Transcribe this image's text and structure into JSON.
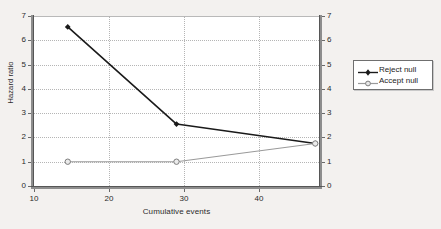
{
  "chart_data": {
    "type": "line",
    "title": "",
    "xlabel": "Cumulative events",
    "ylabel": "Hazard ratio",
    "ylabel_right": "Hazard ratio",
    "xlim": [
      10,
      48
    ],
    "ylim": [
      0,
      7
    ],
    "x_ticks": [
      10,
      20,
      30,
      40
    ],
    "y_ticks": [
      0,
      1,
      2,
      3,
      4,
      5,
      6,
      7
    ],
    "grid": true,
    "legend_position": "right",
    "series": [
      {
        "name": "Reject null",
        "color": "#1a1a1a",
        "marker": "diamond-filled",
        "x": [
          14.5,
          29,
          47.5
        ],
        "values": [
          6.55,
          2.55,
          1.75
        ]
      },
      {
        "name": "Accept null",
        "color": "#9a9a9a",
        "marker": "circle-open",
        "x": [
          14.5,
          29,
          47.5
        ],
        "values": [
          1.0,
          1.0,
          1.75
        ]
      }
    ]
  },
  "axes": {
    "x_tick_labels": [
      "10",
      "20",
      "30",
      "40"
    ],
    "y_tick_labels": [
      "0",
      "1",
      "2",
      "3",
      "4",
      "5",
      "6",
      "7"
    ],
    "x_title": "Cumulative events",
    "y_title": "Hazard ratio"
  },
  "legend": {
    "entries": [
      {
        "label": "Reject null"
      },
      {
        "label": "Accept null"
      }
    ]
  },
  "colors": {
    "page_background": "#f3f1ef",
    "plot_background": "#ffffff",
    "gridline": "#b5b5b5",
    "axis": "#6a6a6a",
    "series_reject": "#1a1a1a",
    "series_accept": "#9a9a9a"
  }
}
